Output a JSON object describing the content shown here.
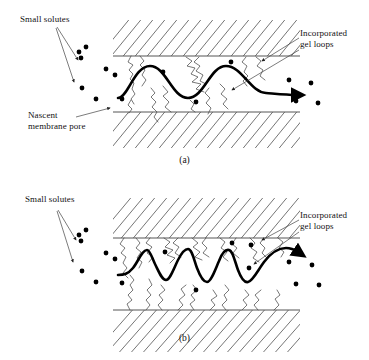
{
  "figure": {
    "panels": [
      {
        "id": "a",
        "caption": "(a)",
        "labels": {
          "small_solutes": "Small solutes",
          "nascent_pore_line1": "Nascent",
          "nascent_pore_line2": "membrane pore",
          "gel_loops_line1": "Incorporated",
          "gel_loops_line2": "gel loops"
        },
        "description": "Sparse gel loops; solute flow path is a smooth low-amplitude sinusoid through the open pore",
        "gel_loop_count": 8,
        "flow_path_oscillations": 2,
        "flow_path_style": "smooth-sinusoid"
      },
      {
        "id": "b",
        "caption": "(b)",
        "labels": {
          "small_solutes": "Small solutes",
          "gel_loops_line1": "Incorporated",
          "gel_loops_line2": "gel loops"
        },
        "description": "Dense gel loops from both pore walls; solute flow path is a high-frequency tortuous sawtooth",
        "gel_loop_count": 18,
        "flow_path_oscillations": 4,
        "flow_path_style": "tortuous-sawtooth"
      }
    ],
    "colors": {
      "background": "#ffffff",
      "ink": "#000000",
      "hatch": "#3a3a3a",
      "wall": "#555555",
      "gel_loop": "#4a4a4a",
      "flow": "#000000"
    },
    "geometry": {
      "membrane_left_x": 113,
      "membrane_right_x": 300,
      "pore_top_y": 56,
      "pore_bottom_y": 112,
      "block_top_y": 20,
      "block_bottom_y": 148
    }
  }
}
